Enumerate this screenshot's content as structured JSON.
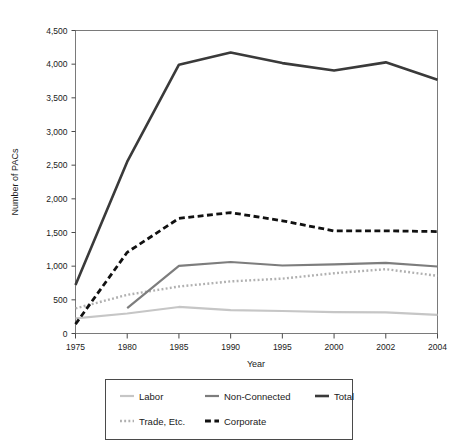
{
  "chart_data": {
    "type": "line",
    "title": "",
    "xlabel": "Year",
    "ylabel": "Number of PACs",
    "x": [
      1975,
      1980,
      1985,
      1990,
      1995,
      2000,
      2002,
      2004
    ],
    "xticklabels": [
      "1975",
      "1980",
      "1985",
      "1990",
      "1995",
      "2000",
      "2002",
      "2004"
    ],
    "yticks": [
      0,
      500,
      1000,
      1500,
      2000,
      2500,
      3000,
      3500,
      4000,
      4500
    ],
    "yticklabels": [
      "0",
      "500",
      "1,000",
      "1,500",
      "2,000",
      "2,500",
      "3,000",
      "3,500",
      "4,000",
      "4,500"
    ],
    "ylim": [
      0,
      4500
    ],
    "xlim": [
      1975,
      2004
    ],
    "grid": false,
    "legend_position": "below-outside",
    "series": [
      {
        "name": "Labor",
        "style": "solid",
        "color": "#c6c6c6",
        "width": 2.2,
        "x": [
          1975,
          1980,
          1985,
          1990,
          1995,
          2000,
          2002,
          2004
        ],
        "values": [
          226,
          297,
          394,
          346,
          334,
          318,
          313,
          278
        ]
      },
      {
        "name": "Trade, Etc.",
        "style": "dotted",
        "color": "#b0b0b0",
        "width": 2.4,
        "x": [
          1975,
          1980,
          1985,
          1990,
          1995,
          2000,
          2002,
          2004
        ],
        "values": [
          373,
          574,
          698,
          774,
          815,
          895,
          955,
          857
        ]
      },
      {
        "name": "Non-Connected",
        "style": "solid",
        "color": "#7d7d7d",
        "width": 2.2,
        "x": [
          1980,
          1985,
          1990,
          1995,
          2000,
          2002,
          2004
        ],
        "values": [
          378,
          1003,
          1062,
          1010,
          1026,
          1048,
          995
        ]
      },
      {
        "name": "Corporate",
        "style": "dashed",
        "color": "#111111",
        "width": 2.8,
        "x": [
          1975,
          1980,
          1985,
          1990,
          1995,
          2000,
          2002,
          2004
        ],
        "values": [
          139,
          1206,
          1710,
          1795,
          1674,
          1523,
          1525,
          1514
        ]
      },
      {
        "name": "Total",
        "style": "solid",
        "color": "#3a3a3a",
        "width": 2.6,
        "x": [
          1975,
          1980,
          1985,
          1990,
          1995,
          2000,
          2002,
          2004
        ],
        "values": [
          722,
          2551,
          3992,
          4172,
          4016,
          3907,
          4027,
          3768
        ]
      }
    ]
  },
  "legend": {
    "entries": [
      {
        "label": "Labor",
        "series": "Labor"
      },
      {
        "label": "Non-Connected",
        "series": "Non-Connected"
      },
      {
        "label": "Total",
        "series": "Total"
      },
      {
        "label": "Trade, Etc.",
        "series": "Trade, Etc."
      },
      {
        "label": "Corporate",
        "series": "Corporate"
      }
    ]
  }
}
